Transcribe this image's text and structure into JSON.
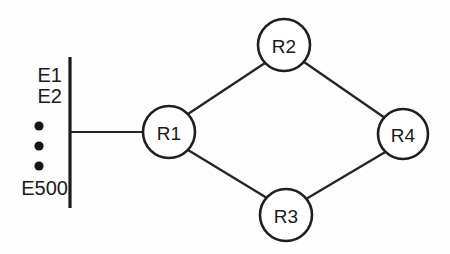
{
  "diagram": {
    "canvas": {
      "width": 450,
      "height": 254,
      "background": "#fdfdfd"
    },
    "colors": {
      "stroke": "#1f1f1f",
      "edge": "#262626",
      "node_fill": "#ffffff",
      "text": "#1a1a1a",
      "dot": "#151515"
    },
    "lan_bar": {
      "name": "lan-segment-bar",
      "x": 70,
      "y1": 57,
      "y2": 208,
      "width": 3.2
    },
    "lan_link": {
      "name": "lan-to-r1-link",
      "x1": 70,
      "y1": 132,
      "x2": 144,
      "y2": 132
    },
    "hosts": [
      {
        "label": "E1",
        "x": 62,
        "y": 75
      },
      {
        "label": "E2",
        "x": 62,
        "y": 96
      },
      {
        "label": "E500",
        "x": 68,
        "y": 188
      }
    ],
    "ellipsis_dots": [
      {
        "cx": 39,
        "cy": 126,
        "r": 4.6
      },
      {
        "cx": 39,
        "cy": 146,
        "r": 4.6
      },
      {
        "cx": 39,
        "cy": 166,
        "r": 4.6
      }
    ],
    "nodes": [
      {
        "id": "R1",
        "label": "R1",
        "cx": 169,
        "cy": 132,
        "r": 26
      },
      {
        "id": "R2",
        "label": "R2",
        "cx": 284,
        "cy": 45,
        "r": 26
      },
      {
        "id": "R3",
        "label": "R3",
        "cx": 286,
        "cy": 215,
        "r": 26
      },
      {
        "id": "R4",
        "label": "R4",
        "cx": 403,
        "cy": 134,
        "r": 25
      }
    ],
    "edges": [
      {
        "id": "R1-R2",
        "from": "R1",
        "to": "R2",
        "x1": 188,
        "y1": 114,
        "x2": 265,
        "y2": 63
      },
      {
        "id": "R1-R3",
        "from": "R1",
        "to": "R3",
        "x1": 188,
        "y1": 150,
        "x2": 267,
        "y2": 198
      },
      {
        "id": "R2-R4",
        "from": "R2",
        "to": "R4",
        "x1": 304,
        "y1": 62,
        "x2": 385,
        "y2": 118
      },
      {
        "id": "R3-R4",
        "from": "R3",
        "to": "R4",
        "x1": 306,
        "y1": 199,
        "x2": 387,
        "y2": 151
      }
    ]
  }
}
